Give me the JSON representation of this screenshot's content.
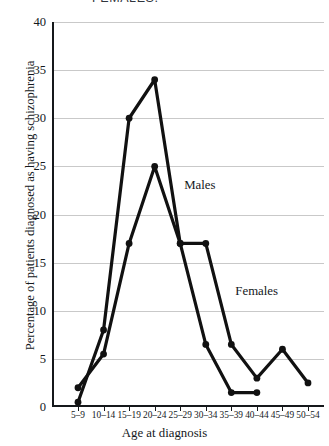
{
  "caption": {
    "text": "FEMALES."
  },
  "chart_data": {
    "type": "line",
    "title": "",
    "xlabel": "Age at diagnosis",
    "ylabel": "Percentage of patients diagnosed as having schizophrenia",
    "categories": [
      "5–9",
      "10–14",
      "15–19",
      "20–24",
      "25–29",
      "30–34",
      "35–39",
      "40–44",
      "45–49",
      "50–54"
    ],
    "ylim": [
      0,
      40
    ],
    "yticks": [
      0,
      5,
      10,
      15,
      20,
      25,
      30,
      35,
      40
    ],
    "grid": true,
    "legend_position": "inline-annotations",
    "series": [
      {
        "name": "Males",
        "color": "#111111",
        "values": [
          0.5,
          8,
          30,
          34,
          17,
          6.5,
          1.5,
          1.5,
          null,
          null
        ]
      },
      {
        "name": "Females",
        "color": "#111111",
        "values": [
          2,
          5.5,
          17,
          25,
          17,
          17,
          6.5,
          3,
          6,
          2.5
        ]
      }
    ],
    "annotations": [
      {
        "text": "Males",
        "category": "25–29",
        "value": 23
      },
      {
        "text": "Females",
        "category": "35–39",
        "value": 12
      }
    ]
  }
}
